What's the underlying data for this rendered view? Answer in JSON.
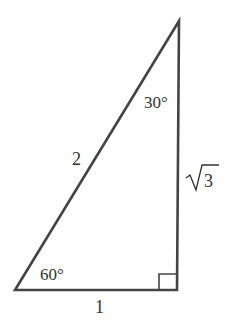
{
  "diagram": {
    "type": "right-triangle",
    "sides": {
      "hypotenuse": "2",
      "base": "1",
      "height_radicand": "3"
    },
    "angles": {
      "top": "30°",
      "bottom_left": "60°",
      "bottom_right": "right-angle"
    },
    "colors": {
      "stroke": "#444444",
      "text": "#333333",
      "background": "#ffffff"
    }
  }
}
